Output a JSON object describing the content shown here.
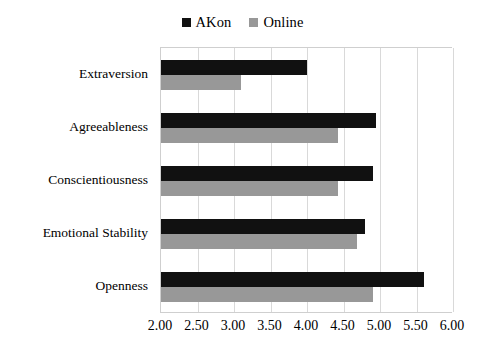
{
  "chart_data": {
    "type": "bar",
    "orientation": "horizontal",
    "title": "",
    "xlabel": "",
    "ylabel": "",
    "xlim": [
      2.0,
      6.0
    ],
    "xtick_step": 0.5,
    "grid": true,
    "legend_position": "top-center",
    "categories": [
      "Extraversion",
      "Agreeableness",
      "Conscientiousness",
      "Emotional Stability",
      "Openness"
    ],
    "xticks": [
      "2.00",
      "2.50",
      "3.00",
      "3.50",
      "4.00",
      "4.50",
      "5.00",
      "5.50",
      "6.00"
    ],
    "xtick_values": [
      2.0,
      2.5,
      3.0,
      3.5,
      4.0,
      4.5,
      5.0,
      5.5,
      6.0
    ],
    "series": [
      {
        "name": "AKon",
        "color": "#111111",
        "values": [
          4.0,
          4.95,
          4.9,
          4.8,
          5.6
        ]
      },
      {
        "name": "Online",
        "color": "#989898",
        "values": [
          3.1,
          4.42,
          4.43,
          4.68,
          4.9
        ]
      }
    ]
  },
  "legend": {
    "entries": [
      {
        "label": "AKon",
        "color": "#111111",
        "marker": "square-marker-akon"
      },
      {
        "label": "Online",
        "color": "#989898",
        "marker": "square-marker-online"
      }
    ]
  }
}
